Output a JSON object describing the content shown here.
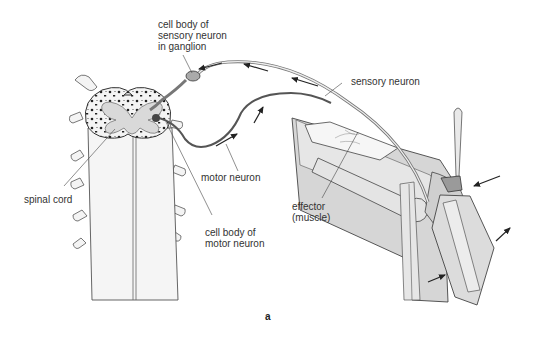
{
  "figure": {
    "panel_label": "a",
    "labels": {
      "cell_body_sensory": "cell body of\nsensory neuron\nin ganglion",
      "sensory_neuron": "sensory neuron",
      "motor_neuron": "motor neuron",
      "spinal_cord": "spinal cord",
      "effector": "effector\n(muscle)",
      "cell_body_motor": "cell body of\nmotor neuron"
    }
  },
  "colors": {
    "background": "#ffffff",
    "line": "#333333",
    "cord_fill": "#f2f2f2",
    "grey_matter": "#d9d9d9",
    "leg_fill": "#d6d6d6",
    "leg_light": "#ececec",
    "bone_fill": "#e2e2e2",
    "neuron": "#777777"
  }
}
